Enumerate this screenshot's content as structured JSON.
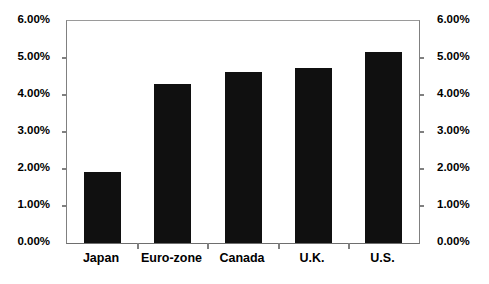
{
  "chart_data": {
    "type": "bar",
    "title": "",
    "subtitle": "",
    "xlabel": "",
    "ylabel": "",
    "categories": [
      "Japan",
      "Euro-zone",
      "Canada",
      "U.K.",
      "U.S."
    ],
    "values": [
      1.93,
      4.29,
      4.63,
      4.72,
      5.17
    ],
    "value_unit": "%",
    "series": [
      {
        "name": "Rate",
        "values": [
          1.93,
          4.29,
          4.63,
          4.72,
          5.17
        ],
        "color": "#101010"
      }
    ],
    "ylim": [
      0,
      6
    ],
    "ytick_step": 1,
    "ytick_values": [
      0,
      1,
      2,
      3,
      4,
      5,
      6
    ],
    "ytick_labels": [
      "0.00%",
      "1.00%",
      "2.00%",
      "3.00%",
      "4.00%",
      "5.00%",
      "6.00%"
    ],
    "left_axis": {
      "position": "left",
      "labels": [
        "6.00%",
        "5.00%",
        "4.00%",
        "3.00%",
        "2.00%",
        "1.00%",
        "0.00%"
      ]
    },
    "right_axis": {
      "position": "right",
      "labels": [
        "6.00%",
        "5.00%",
        "4.00%",
        "3.00%",
        "2.00%",
        "1.00%",
        "0.00%"
      ]
    },
    "grid": false,
    "legend": null,
    "annotations": [],
    "colors": {
      "bar": "#101010",
      "axis": "#808080",
      "text": "#000000",
      "background": "#ffffff"
    }
  }
}
